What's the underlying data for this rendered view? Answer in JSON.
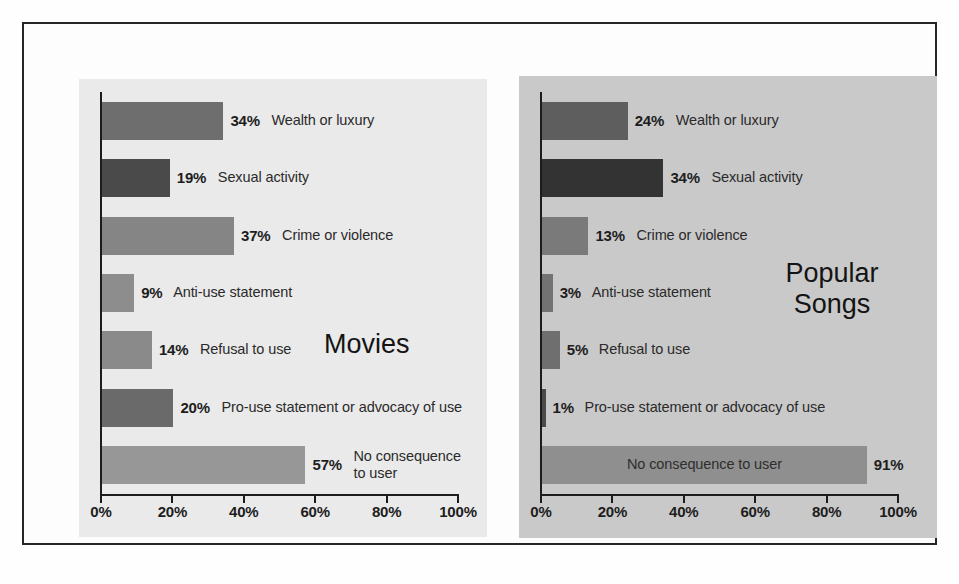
{
  "figure": {
    "panels": [
      "Movies",
      "Popular Songs"
    ]
  },
  "chart_data": [
    {
      "type": "bar",
      "orientation": "horizontal",
      "title": "Movies",
      "xlabel": "",
      "ylabel": "",
      "xlim": [
        0,
        100
      ],
      "xticks": [
        "0%",
        "20%",
        "40%",
        "60%",
        "80%",
        "100%"
      ],
      "xtick_values": [
        0,
        20,
        40,
        60,
        80,
        100
      ],
      "grid": false,
      "legend": "none",
      "categories": [
        "Wealth or luxury",
        "Sexual activity",
        "Crime or violence",
        "Anti-use statement",
        "Refusal to use",
        "Pro-use statement or advocacy of use",
        "No consequence\nto user"
      ],
      "values": [
        34,
        19,
        37,
        9,
        14,
        20,
        57
      ],
      "value_labels": [
        "34%",
        "19%",
        "37%",
        "9%",
        "14%",
        "20%",
        "57%"
      ],
      "bar_colors": [
        "#6e6e6e",
        "#4a4a4a",
        "#858585",
        "#8d8d8d",
        "#8a8a8a",
        "#6a6a6a",
        "#979797"
      ],
      "label_inside": [
        false,
        false,
        false,
        false,
        false,
        false,
        false
      ]
    },
    {
      "type": "bar",
      "orientation": "horizontal",
      "title": "Popular Songs",
      "xlabel": "",
      "ylabel": "",
      "xlim": [
        0,
        100
      ],
      "xticks": [
        "0%",
        "20%",
        "40%",
        "60%",
        "80%",
        "100%"
      ],
      "xtick_values": [
        0,
        20,
        40,
        60,
        80,
        100
      ],
      "grid": false,
      "legend": "none",
      "categories": [
        "Wealth or luxury",
        "Sexual activity",
        "Crime or violence",
        "Anti-use statement",
        "Refusal to use",
        "Pro-use statement or advocacy of use",
        "No consequence to user"
      ],
      "values": [
        24,
        34,
        13,
        3,
        5,
        1,
        91
      ],
      "value_labels": [
        "24%",
        "34%",
        "13%",
        "3%",
        "5%",
        "1%",
        "91%"
      ],
      "bar_colors": [
        "#5e5e5e",
        "#333333",
        "#7a7a7a",
        "#737373",
        "#6f6f6f",
        "#4b4b4b",
        "#8f8f8f"
      ],
      "label_inside": [
        false,
        false,
        false,
        false,
        false,
        false,
        true
      ]
    }
  ],
  "colors": {
    "frame": "#262626",
    "axis": "#1c1c1c",
    "left_panel_bg": "#eaeaea",
    "right_panel_bg": "#c9c9c9",
    "text": "#1d1d1d"
  }
}
